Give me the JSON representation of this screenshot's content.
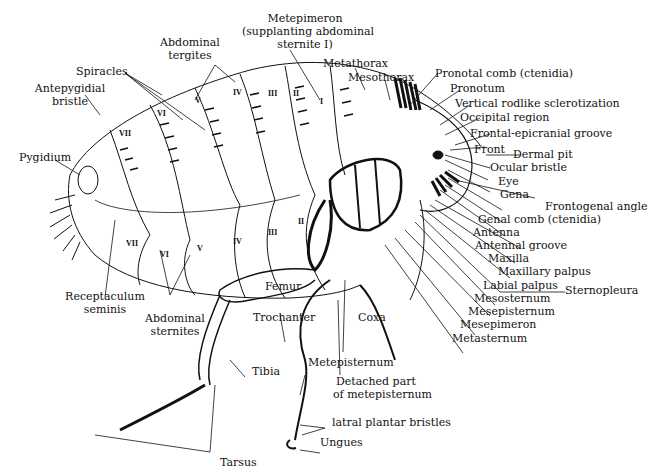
{
  "diagram": {
    "labels": {
      "metepimeron": "Metepimeron",
      "metepimeron_note1": "(supplanting abdominal",
      "metepimeron_note2": "sternite I)",
      "abdominal_tergites_1": "Abdominal",
      "abdominal_tergites_2": "tergites",
      "spiracles": "Spiracles",
      "antepygidial_1": "Antepygidial",
      "antepygidial_2": "bristle",
      "metathorax": "Metathorax",
      "mesothorax": "Mesothorax",
      "pronotal_comb": "Pronotal comb (ctenidia)",
      "pronotum": "Pronotum",
      "vertical_rodlike": "Vertical rodlike sclerotization",
      "occipital": "Occipital region",
      "frontal_epicranial": "Frontal-epicranial groove",
      "front": "Front",
      "dermal_pit": "Dermal pit",
      "ocular_bristle": "Ocular bristle",
      "eye": "Eye",
      "gena": "Gena",
      "frontogenal": "Frontogenal angle",
      "genal_comb": "Genal comb (ctenidia)",
      "antenna": "Antenna",
      "antennal_groove": "Antennal groove",
      "maxilla": "Maxilla",
      "maxillary_palpus": "Maxillary palpus",
      "labial_palpus": "Labial palpus",
      "sternopleura": "Sternopleura",
      "mesosternum": "Mesosternum",
      "mesepisternum": "Mesepisternum",
      "mesepimeron": "Mesepimeron",
      "metasternum": "Metasternum",
      "pygidium": "Pygidium",
      "receptaculum_1": "Receptaculum",
      "receptaculum_2": "seminis",
      "abdominal_sternites_1": "Abdominal",
      "abdominal_sternites_2": "sternites",
      "femur": "Femur",
      "trochanter": "Trochanter",
      "coxa": "Coxa",
      "tibia": "Tibia",
      "metepisternum": "Metepisternum",
      "detached_1": "Detached part",
      "detached_2": "of metepisternum",
      "lateral_plantar": "latral plantar bristles",
      "ungues": "Ungues",
      "tarsus": "Tarsus"
    },
    "segment_numerals": {
      "tergites": [
        "VII",
        "VI",
        "V",
        "IV",
        "III",
        "II",
        "I"
      ],
      "sternites": [
        "VII",
        "VI",
        "V",
        "IV",
        "III",
        "II"
      ]
    }
  }
}
